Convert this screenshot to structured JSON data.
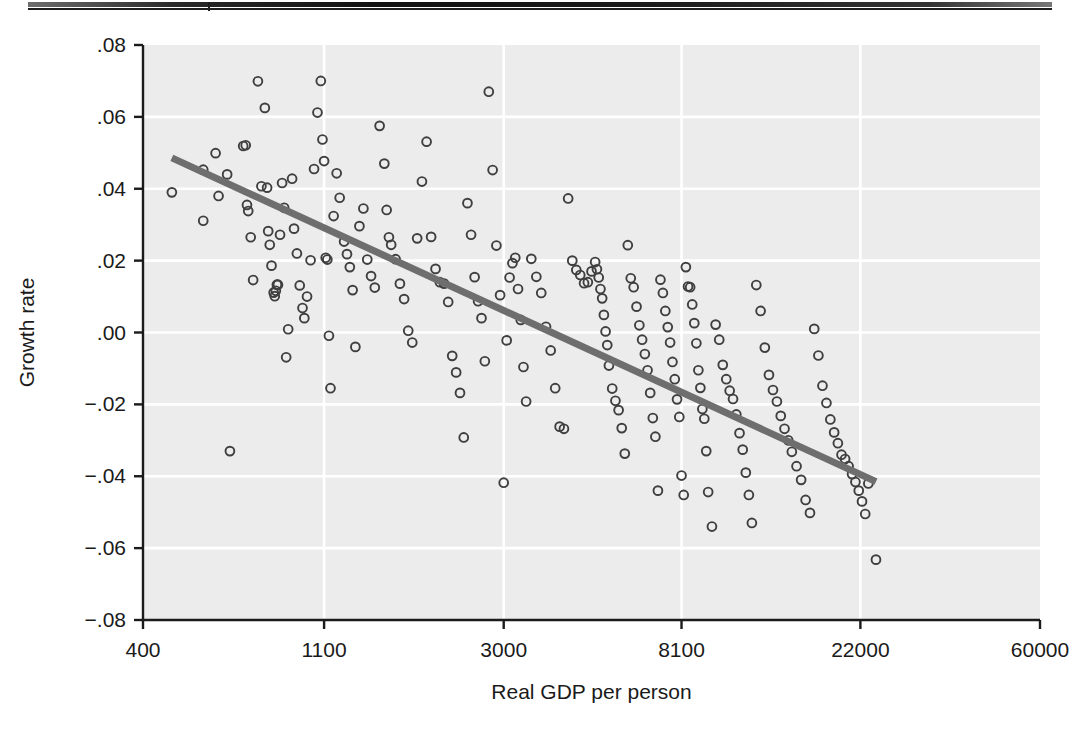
{
  "figure": {
    "top_rule_name": "header-rule"
  },
  "chart_data": {
    "type": "scatter",
    "title": "",
    "xlabel": "Real GDP per person",
    "ylabel": "Growth rate",
    "xscale": "log",
    "yscale": "linear",
    "xlim": [
      400,
      60000
    ],
    "ylim": [
      -0.08,
      0.08
    ],
    "xticks": [
      400,
      1100,
      3000,
      8100,
      22000,
      60000
    ],
    "xtick_labels": [
      "400",
      "1100",
      "3000",
      "8100",
      "22000",
      "60000"
    ],
    "yticks": [
      0.08,
      0.06,
      0.04,
      0.02,
      0.0,
      -0.02,
      -0.04,
      -0.06,
      -0.08
    ],
    "ytick_labels": [
      ".08",
      ".06",
      ".04",
      ".02",
      ".00",
      "−.02",
      "−.04",
      "−.06",
      "−.08"
    ],
    "grid": "white gridlines on light gray panel, both axes",
    "legend": "none",
    "marker": "open circle",
    "colors": {
      "panel": "#ececec",
      "gridline": "#ffffff",
      "marker_stroke": "#3f3f3f",
      "marker_fill": "none",
      "fit_line": "#6e6e6e",
      "axis": "#1b1b1b",
      "text": "#1a1a1a"
    },
    "fit_line": {
      "name": "linear fit on log(GDP)",
      "x_start": 470,
      "y_start": 0.0486,
      "x_end": 24000,
      "y_end": -0.0415
    },
    "points": [
      [
        470,
        0.039
      ],
      [
        560,
        0.0453
      ],
      [
        560,
        0.0311
      ],
      [
        600,
        0.0499
      ],
      [
        610,
        0.038
      ],
      [
        640,
        0.044
      ],
      [
        650,
        -0.033
      ],
      [
        700,
        0.0519
      ],
      [
        710,
        0.0521
      ],
      [
        715,
        0.0355
      ],
      [
        720,
        0.0338
      ],
      [
        730,
        0.0265
      ],
      [
        740,
        0.0146
      ],
      [
        760,
        0.0699
      ],
      [
        775,
        0.0407
      ],
      [
        790,
        0.0625
      ],
      [
        800,
        0.0403
      ],
      [
        805,
        0.0282
      ],
      [
        812,
        0.0244
      ],
      [
        820,
        0.0186
      ],
      [
        830,
        0.0111
      ],
      [
        835,
        0.0101
      ],
      [
        840,
        0.0116
      ],
      [
        845,
        0.0133
      ],
      [
        850,
        0.0133
      ],
      [
        860,
        0.0272
      ],
      [
        870,
        0.0416
      ],
      [
        880,
        0.0347
      ],
      [
        890,
        -0.0069
      ],
      [
        900,
        0.0009
      ],
      [
        920,
        0.0428
      ],
      [
        930,
        0.0289
      ],
      [
        945,
        0.022
      ],
      [
        960,
        0.0131
      ],
      [
        975,
        0.0068
      ],
      [
        985,
        0.004
      ],
      [
        1000,
        0.01
      ],
      [
        1020,
        0.0201
      ],
      [
        1040,
        0.0455
      ],
      [
        1060,
        0.0612
      ],
      [
        1080,
        0.07
      ],
      [
        1090,
        0.0537
      ],
      [
        1100,
        0.0477
      ],
      [
        1110,
        0.0208
      ],
      [
        1120,
        0.0203
      ],
      [
        1130,
        -0.0009
      ],
      [
        1140,
        -0.0155
      ],
      [
        1160,
        0.0324
      ],
      [
        1180,
        0.0443
      ],
      [
        1200,
        0.0375
      ],
      [
        1230,
        0.0253
      ],
      [
        1250,
        0.0218
      ],
      [
        1270,
        0.0182
      ],
      [
        1290,
        0.0118
      ],
      [
        1310,
        -0.004
      ],
      [
        1340,
        0.0296
      ],
      [
        1370,
        0.0345
      ],
      [
        1400,
        0.0203
      ],
      [
        1430,
        0.0157
      ],
      [
        1460,
        0.0125
      ],
      [
        1500,
        0.0575
      ],
      [
        1540,
        0.047
      ],
      [
        1560,
        0.0341
      ],
      [
        1580,
        0.0265
      ],
      [
        1600,
        0.0244
      ],
      [
        1640,
        0.0204
      ],
      [
        1680,
        0.0136
      ],
      [
        1720,
        0.0093
      ],
      [
        1760,
        0.0005
      ],
      [
        1800,
        -0.0028
      ],
      [
        1850,
        0.0262
      ],
      [
        1900,
        0.042
      ],
      [
        1950,
        0.0531
      ],
      [
        2000,
        0.0266
      ],
      [
        2050,
        0.0177
      ],
      [
        2100,
        0.014
      ],
      [
        2150,
        0.0136
      ],
      [
        2200,
        0.0085
      ],
      [
        2250,
        -0.0065
      ],
      [
        2300,
        -0.0111
      ],
      [
        2350,
        -0.0168
      ],
      [
        2400,
        -0.0292
      ],
      [
        2450,
        0.036
      ],
      [
        2500,
        0.0272
      ],
      [
        2550,
        0.0154
      ],
      [
        2600,
        0.0087
      ],
      [
        2650,
        0.004
      ],
      [
        2700,
        -0.008
      ],
      [
        2760,
        0.067
      ],
      [
        2820,
        0.0452
      ],
      [
        2880,
        0.0242
      ],
      [
        2940,
        0.0104
      ],
      [
        3000,
        -0.0418
      ],
      [
        3050,
        -0.0022
      ],
      [
        3100,
        0.0153
      ],
      [
        3150,
        0.0193
      ],
      [
        3200,
        0.0208
      ],
      [
        3250,
        0.0121
      ],
      [
        3300,
        0.0035
      ],
      [
        3350,
        -0.0096
      ],
      [
        3400,
        -0.0192
      ],
      [
        3500,
        0.0205
      ],
      [
        3600,
        0.0155
      ],
      [
        3700,
        0.011
      ],
      [
        3800,
        0.0016
      ],
      [
        3900,
        -0.005
      ],
      [
        4000,
        -0.0155
      ],
      [
        4100,
        -0.0262
      ],
      [
        4200,
        -0.0268
      ],
      [
        4300,
        0.0373
      ],
      [
        4400,
        0.02
      ],
      [
        4500,
        0.0174
      ],
      [
        4600,
        0.016
      ],
      [
        4700,
        0.0137
      ],
      [
        4800,
        0.014
      ],
      [
        4900,
        0.017
      ],
      [
        5000,
        0.0196
      ],
      [
        5050,
        0.0176
      ],
      [
        5100,
        0.0153
      ],
      [
        5150,
        0.0121
      ],
      [
        5200,
        0.0095
      ],
      [
        5250,
        0.0049
      ],
      [
        5300,
        0.0003
      ],
      [
        5350,
        -0.0035
      ],
      [
        5400,
        -0.0092
      ],
      [
        5500,
        -0.0156
      ],
      [
        5600,
        -0.019
      ],
      [
        5700,
        -0.0216
      ],
      [
        5800,
        -0.0266
      ],
      [
        5900,
        -0.0337
      ],
      [
        6000,
        0.0243
      ],
      [
        6100,
        0.0151
      ],
      [
        6200,
        0.0126
      ],
      [
        6300,
        0.0072
      ],
      [
        6400,
        0.002
      ],
      [
        6500,
        -0.002
      ],
      [
        6600,
        -0.006
      ],
      [
        6700,
        -0.0105
      ],
      [
        6800,
        -0.0168
      ],
      [
        6900,
        -0.0238
      ],
      [
        7000,
        -0.029
      ],
      [
        7100,
        -0.044
      ],
      [
        7200,
        0.0147
      ],
      [
        7300,
        0.011
      ],
      [
        7400,
        0.006
      ],
      [
        7500,
        0.0015
      ],
      [
        7600,
        -0.0028
      ],
      [
        7700,
        -0.0082
      ],
      [
        7800,
        -0.013
      ],
      [
        7900,
        -0.0186
      ],
      [
        8000,
        -0.0235
      ],
      [
        8100,
        -0.0398
      ],
      [
        8200,
        -0.0452
      ],
      [
        8300,
        0.0182
      ],
      [
        8400,
        0.0128
      ],
      [
        8500,
        0.0126
      ],
      [
        8600,
        0.0078
      ],
      [
        8700,
        0.0026
      ],
      [
        8800,
        -0.003
      ],
      [
        8900,
        -0.0105
      ],
      [
        9000,
        -0.0154
      ],
      [
        9100,
        -0.0213
      ],
      [
        9200,
        -0.024
      ],
      [
        9300,
        -0.033
      ],
      [
        9400,
        -0.0444
      ],
      [
        9600,
        -0.054
      ],
      [
        9800,
        0.0022
      ],
      [
        10000,
        -0.002
      ],
      [
        10200,
        -0.009
      ],
      [
        10400,
        -0.013
      ],
      [
        10600,
        -0.0162
      ],
      [
        10800,
        -0.0185
      ],
      [
        11000,
        -0.0228
      ],
      [
        11200,
        -0.028
      ],
      [
        11400,
        -0.0326
      ],
      [
        11600,
        -0.039
      ],
      [
        11800,
        -0.0452
      ],
      [
        12000,
        -0.053
      ],
      [
        12300,
        0.0132
      ],
      [
        12600,
        0.006
      ],
      [
        12900,
        -0.0042
      ],
      [
        13200,
        -0.0118
      ],
      [
        13500,
        -0.016
      ],
      [
        13800,
        -0.0192
      ],
      [
        14100,
        -0.0232
      ],
      [
        14400,
        -0.0268
      ],
      [
        14700,
        -0.03
      ],
      [
        15000,
        -0.0332
      ],
      [
        15400,
        -0.0372
      ],
      [
        15800,
        -0.041
      ],
      [
        16200,
        -0.0466
      ],
      [
        16600,
        -0.0502
      ],
      [
        17000,
        0.001
      ],
      [
        17400,
        -0.0064
      ],
      [
        17800,
        -0.0148
      ],
      [
        18200,
        -0.0196
      ],
      [
        18600,
        -0.0242
      ],
      [
        19000,
        -0.0278
      ],
      [
        19400,
        -0.0308
      ],
      [
        19800,
        -0.034
      ],
      [
        20200,
        -0.0352
      ],
      [
        20600,
        -0.0372
      ],
      [
        21000,
        -0.0394
      ],
      [
        21400,
        -0.0416
      ],
      [
        21800,
        -0.044
      ],
      [
        22200,
        -0.047
      ],
      [
        22600,
        -0.0505
      ],
      [
        23000,
        -0.042
      ],
      [
        24000,
        -0.0632
      ]
    ]
  }
}
